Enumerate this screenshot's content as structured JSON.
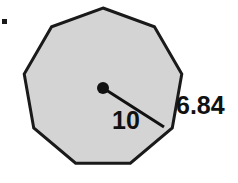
{
  "figure": {
    "name": "regular-nonagon-with-radius-and-side-labels",
    "background_color": "#ffffff",
    "bullet_marker": {
      "icon": "bullet-square-icon",
      "color": "#1a1a1a",
      "x": 2,
      "y": 19,
      "size": 5
    },
    "polygon": {
      "shape": "regular-nonagon",
      "sides": 9,
      "fill_color": "#d4d4d4",
      "stroke_color": "#1a1a1a",
      "stroke_width": 3,
      "center_x": 103,
      "center_y": 88,
      "circumradius": 80,
      "start_angle_deg": -90,
      "points": "103.0,8.0 154.4,26.7 178.8,75.5 169.9,129.2 128.1,164.1 77.9,164.1 36.1,129.2 27.2,75.5 51.6,26.7"
    },
    "center_dot": {
      "icon": "center-point-dot-icon",
      "color": "#111111",
      "cx": 103,
      "cy": 88,
      "r": 6
    },
    "radius_segment": {
      "x1": 103,
      "y1": 88,
      "x2": 164,
      "y2": 127,
      "color": "#111111",
      "width": 3
    },
    "labels": {
      "radius": {
        "text": "10",
        "x": 112,
        "y": 129,
        "anchor": "start"
      },
      "apothem": {
        "text": "6.84",
        "x": 176,
        "y": 114,
        "anchor": "start"
      }
    }
  },
  "chart_data": {
    "type": "diagram",
    "subtype": "regular-polygon-geometry",
    "title": "",
    "shape": "regular nonagon",
    "sides": 9,
    "annotations": [
      {
        "label": "10",
        "meaning": "radius (distance from center to vertex)",
        "value": 10,
        "from": "center",
        "to": "vertex"
      },
      {
        "label": "6.84",
        "meaning": "side length of the nonagon",
        "value": 6.84,
        "edge": "right-side edge"
      }
    ],
    "fill_color": "#d4d4d4",
    "stroke_color": "#1a1a1a",
    "legend": "none",
    "grid": false
  }
}
